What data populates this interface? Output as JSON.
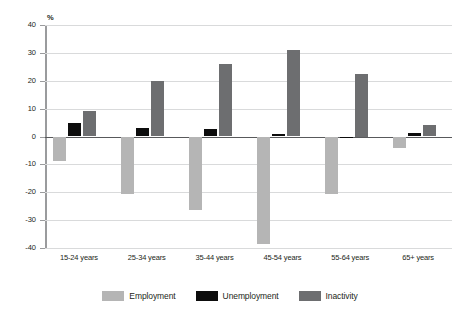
{
  "chart_data": {
    "type": "bar",
    "title": "",
    "subtitle": "",
    "xlabel": "",
    "ylabel": "%",
    "unit_label": "%",
    "categories": [
      "15-24 years",
      "25-34 years",
      "35-44 years",
      "45-54 years",
      "55-64 years",
      "65+ years"
    ],
    "series": [
      {
        "name": "Employment",
        "color": "#b5b5b5",
        "values": [
          -8.8,
          -20.5,
          -26.5,
          -38.5,
          -20.5,
          -4.0
        ]
      },
      {
        "name": "Unemployment",
        "color": "#0d0d0d",
        "values": [
          4.8,
          3.2,
          2.6,
          1.0,
          -0.6,
          1.2
        ]
      },
      {
        "name": "Inactivity",
        "color": "#6d6e70",
        "values": [
          9.2,
          19.8,
          26.0,
          31.0,
          22.5,
          4.2
        ]
      }
    ],
    "ylim": [
      -40,
      40
    ],
    "yticks": [
      40,
      30,
      20,
      10,
      0,
      -10,
      -20,
      -30,
      -40
    ],
    "ytick_labels": [
      "40",
      "30",
      "20",
      "10",
      "0",
      "-10",
      "-20",
      "-30",
      "-40"
    ],
    "grid": true,
    "legend_position": "bottom"
  },
  "legend": {
    "items": [
      {
        "label": "Employment",
        "swatch": "employment"
      },
      {
        "label": "Unemployment",
        "swatch": "unemployment"
      },
      {
        "label": "Inactivity",
        "swatch": "inactivity"
      }
    ]
  }
}
